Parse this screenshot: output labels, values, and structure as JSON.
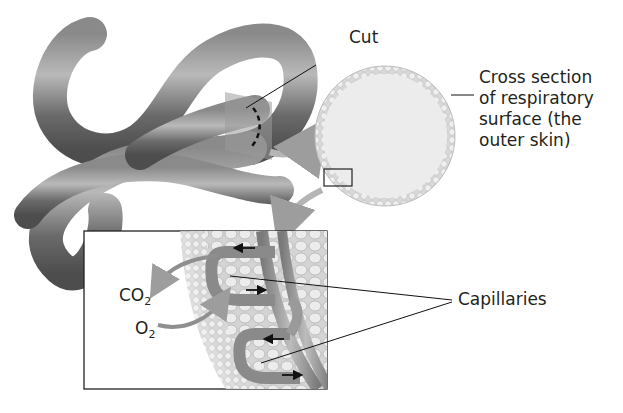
{
  "figure": {
    "labels": {
      "cut": "Cut",
      "cross_section_lines": [
        "Cross section",
        "of respiratory",
        "surface (the",
        "outer skin)"
      ],
      "capillaries": "Capillaries",
      "co2_base": "CO",
      "co2_sub": "2",
      "o2_base": "O",
      "o2_sub": "2"
    },
    "colors": {
      "worm": "#6e6e6e",
      "worm_highlight": "#a8a8a8",
      "cut_plane": "#9b9b9b",
      "cross_section_fill": "#ececec",
      "cross_section_ring": "#c9c9c9",
      "tissue": "#dcdcdc",
      "vessel": "#8c8c8c",
      "flow_arrow": "#9d9d9d",
      "text": "#231f20"
    }
  }
}
